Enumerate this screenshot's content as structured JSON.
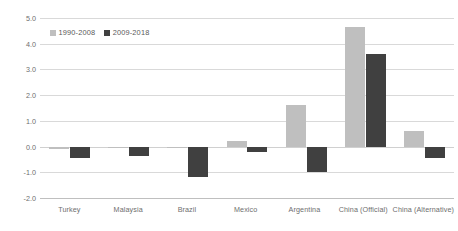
{
  "chart_data": {
    "type": "bar",
    "title": "",
    "subtitle": "",
    "xlabel": "",
    "ylabel": "",
    "categories": [
      "Turkey",
      "Malaysia",
      "Brazil",
      "Mexico",
      "Argentina",
      "China (Official)",
      "China (Alternative)"
    ],
    "series": [
      {
        "name": "1990-2008",
        "color": "#bfbfbf",
        "values": [
          -0.1,
          -0.05,
          -0.05,
          0.2,
          1.6,
          4.65,
          0.6
        ]
      },
      {
        "name": "2009-2018",
        "color": "#404040",
        "values": [
          -0.45,
          -0.35,
          -1.2,
          -0.2,
          -1.0,
          3.6,
          -0.45
        ]
      }
    ],
    "ylim": [
      -2.0,
      5.0
    ],
    "yticks": [
      5.0,
      4.0,
      3.0,
      2.0,
      1.0,
      0.0,
      -1.0,
      -2.0
    ],
    "ytick_labels": [
      "5.0",
      "4.0",
      "3.0",
      "2.0",
      "1.0",
      "0.0",
      "-1.0",
      "-2.0"
    ],
    "grid": true,
    "legend_position": "top-left",
    "gridline_color": "#d9d9d9",
    "axis_text_color": "#6e6e6e",
    "background_color": "#ffffff"
  }
}
